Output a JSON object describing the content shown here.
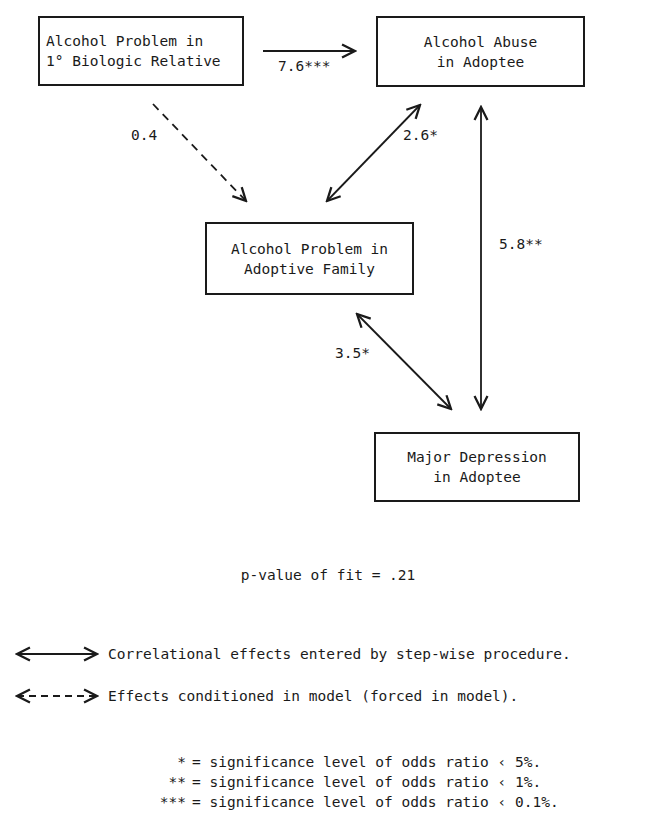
{
  "nodes": {
    "biologic_relative": {
      "line1": "Alcohol Problem in",
      "line2": "1° Biologic Relative"
    },
    "alcohol_abuse": {
      "line1": "Alcohol Abuse",
      "line2": "in Adoptee"
    },
    "adoptive_family": {
      "line1": "Alcohol Problem in",
      "line2": "Adoptive Family"
    },
    "major_depression": {
      "line1": "Major Depression",
      "line2": "in Adoptee"
    }
  },
  "edges": {
    "biologic_to_abuse": {
      "label": "7.6***",
      "style": "solid",
      "direction": "one-way"
    },
    "biologic_to_adoptive": {
      "label": "0.4",
      "style": "dashed",
      "direction": "one-way"
    },
    "adoptive_abuse": {
      "label": "2.6*",
      "style": "solid",
      "direction": "two-way"
    },
    "abuse_depression": {
      "label": "5.8**",
      "style": "solid",
      "direction": "two-way"
    },
    "adoptive_depression": {
      "label": "3.5*",
      "style": "solid",
      "direction": "two-way"
    }
  },
  "fit": {
    "text": "p-value of fit = .21"
  },
  "legend": {
    "solid": "Correlational effects entered by step-wise procedure.",
    "dashed": "Effects conditioned in model (forced in model)."
  },
  "significance": [
    {
      "symbol": "*",
      "text": "= significance level of odds ratio ‹ 5%."
    },
    {
      "symbol": "**",
      "text": "= significance level of odds ratio ‹ 1%."
    },
    {
      "symbol": "***",
      "text": "= significance level of odds ratio ‹ 0.1%."
    }
  ]
}
